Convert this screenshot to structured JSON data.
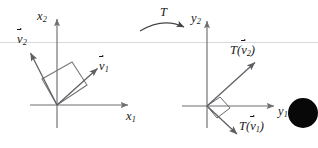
{
  "figure": {
    "background_color": "#ffffff",
    "ink_color": "#18181a",
    "line_color": "#6f6f72",
    "scanline_color": "#d9d9dc",
    "blob_color": "#080808",
    "width": 318,
    "height": 148
  },
  "left_diagram": {
    "name": "domain-plane",
    "origin": {
      "x": 57,
      "y": 105
    },
    "axes": [
      {
        "name": "x1",
        "label_main": "x",
        "label_sub": "1",
        "direction": "horizontal-right"
      },
      {
        "name": "x2",
        "label_main": "x",
        "label_sub": "2",
        "direction": "vertical-up"
      }
    ],
    "vectors": [
      {
        "name": "v1",
        "label_main": "v",
        "label_sub": "1",
        "has_arrow_accent": true,
        "tip": {
          "x": 97,
          "y": 68
        }
      },
      {
        "name": "v2",
        "label_main": "v",
        "label_sub": "2",
        "has_arrow_accent": true,
        "tip": {
          "x": 30,
          "y": 52
        }
      }
    ],
    "shape": {
      "name": "unit-square",
      "vertices": [
        [
          57,
          105
        ],
        [
          87,
          85
        ],
        [
          72,
          62
        ],
        [
          42,
          79
        ]
      ]
    }
  },
  "transform_arrow": {
    "name": "transform-arrow",
    "label": "T",
    "from": {
      "x": 140,
      "y": 30
    },
    "to": {
      "x": 186,
      "y": 28
    }
  },
  "right_diagram": {
    "name": "codomain-plane",
    "origin": {
      "x": 207,
      "y": 106
    },
    "axes": [
      {
        "name": "y1",
        "label_main": "y",
        "label_sub": "1",
        "direction": "horizontal-right"
      },
      {
        "name": "y2",
        "label_main": "y",
        "label_sub": "2",
        "direction": "vertical-up"
      }
    ],
    "vectors": [
      {
        "name": "T-of-v2",
        "prefix": "T(",
        "label_main": "v",
        "label_sub": "2",
        "suffix": ")",
        "has_arrow_accent": true,
        "tip": {
          "x": 255,
          "y": 62
        }
      },
      {
        "name": "T-of-v1",
        "prefix": "T(",
        "label_main": "v",
        "label_sub": "1",
        "suffix": ")",
        "has_arrow_accent": true,
        "tip": {
          "x": 237,
          "y": 135
        }
      }
    ],
    "right_angle_marker": {
      "name": "right-angle-marker",
      "vertices": [
        [
          207,
          106
        ],
        [
          220,
          97
        ],
        [
          230,
          108
        ],
        [
          217,
          118
        ]
      ]
    }
  },
  "blob": {
    "name": "black-disc",
    "center": {
      "x": 303,
      "y": 113
    },
    "radius": 15
  },
  "scanline": {
    "name": "horizontal-artifact-line",
    "y": 42
  }
}
